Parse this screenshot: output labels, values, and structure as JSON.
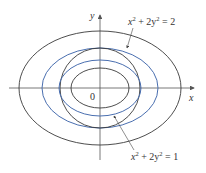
{
  "figure": {
    "axes": {
      "x_label": "x",
      "y_label": "y",
      "origin_label": "0"
    },
    "colors": {
      "black_curve": "#3a3a3a",
      "blue_curve": "#4a6fb0",
      "axis": "#555555"
    },
    "annotations": [
      {
        "text_base": "x",
        "sup1": "2",
        "mid": " + 2y",
        "sup2": "2",
        "rhs": " = 2",
        "target": "outer blue ellipse"
      },
      {
        "text_base": "x",
        "sup1": "2",
        "mid": " + 2y",
        "sup2": "2",
        "rhs": " = 1",
        "target": "inner blue ellipse"
      }
    ],
    "curves": [
      {
        "name": "outer-black-ellipse",
        "color": "black",
        "rx": 81,
        "ry": 57
      },
      {
        "name": "blue-ellipse-level-2",
        "color": "blue",
        "rx": 58,
        "ry": 40
      },
      {
        "name": "black-circle",
        "color": "black",
        "rx": 40,
        "ry": 40
      },
      {
        "name": "blue-ellipse-level-1",
        "color": "blue",
        "rx": 41,
        "ry": 28
      },
      {
        "name": "inner-black-ellipse",
        "color": "black",
        "rx": 29,
        "ry": 20
      }
    ]
  }
}
